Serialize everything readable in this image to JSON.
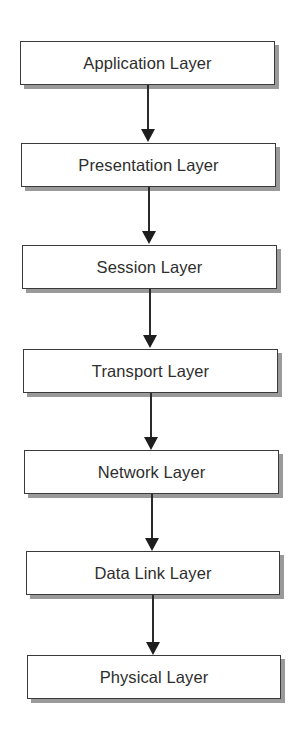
{
  "diagram": {
    "type": "flowchart",
    "direction": "top-to-bottom",
    "layers": [
      {
        "label": "Application Layer"
      },
      {
        "label": "Presentation Layer"
      },
      {
        "label": "Session Layer"
      },
      {
        "label": "Transport Layer"
      },
      {
        "label": "Network Layer"
      },
      {
        "label": "Data Link Layer"
      },
      {
        "label": "Physical Layer"
      }
    ],
    "edges": [
      {
        "from": "Application Layer",
        "to": "Presentation Layer"
      },
      {
        "from": "Presentation Layer",
        "to": "Session Layer"
      },
      {
        "from": "Session Layer",
        "to": "Transport Layer"
      },
      {
        "from": "Transport Layer",
        "to": "Network Layer"
      },
      {
        "from": "Network Layer",
        "to": "Data Link Layer"
      },
      {
        "from": "Data Link Layer",
        "to": "Physical Layer"
      }
    ]
  },
  "colors": {
    "box_border": "#3a3a3a",
    "box_shadow": "#9a9a9a",
    "text": "#2e2e2e",
    "arrow": "#1e1e1e",
    "background": "#ffffff"
  }
}
